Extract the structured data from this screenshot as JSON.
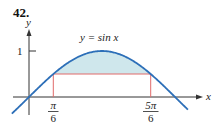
{
  "problem_number": "42.",
  "colors": {
    "curve": "#2d6fb8",
    "shade": "#cfe7ec",
    "rectangle": "#e06a6a",
    "axes": "#333333"
  },
  "axes": {
    "x_label": "x",
    "y_label": "y",
    "y_tick": "1"
  },
  "curve": {
    "label": "y = sin x",
    "function": "sin(x)"
  },
  "x_ticks": [
    {
      "numerator": "π",
      "denominator": "6",
      "value": "pi/6"
    },
    {
      "numerator": "5π",
      "denominator": "6",
      "value": "5pi/6"
    }
  ],
  "chart_data": {
    "type": "line",
    "title": "",
    "xlabel": "x",
    "ylabel": "y",
    "series": [
      {
        "name": "y = sin x",
        "x_range": [
          -0.37,
          3.42
        ]
      }
    ],
    "rectangle": {
      "x": [
        0.5236,
        2.618
      ],
      "y": [
        0,
        0.5
      ]
    },
    "shaded_region": "between y = sin x and y = 1/2 for π/6 ≤ x ≤ 5π/6",
    "tick_labels_x": [
      "π/6",
      "5π/6"
    ],
    "tick_labels_y": [
      "1"
    ]
  }
}
